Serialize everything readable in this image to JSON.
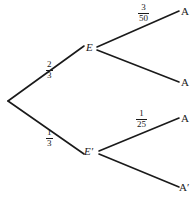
{
  "diagram": {
    "type": "probability-tree",
    "title": "",
    "background_color": "#ffffff",
    "line_color": "#1a1a1a",
    "root": {
      "label": "",
      "x": 8,
      "y": 101
    },
    "nodes": [
      {
        "id": "E",
        "label": "E",
        "x": 88,
        "y": 48
      },
      {
        "id": "Eprime",
        "label": "E′",
        "x": 88,
        "y": 152
      }
    ],
    "leaves": [
      {
        "id": "leaf-1",
        "label": "A",
        "x": 181,
        "y": 12
      },
      {
        "id": "leaf-2",
        "label": "A",
        "x": 181,
        "y": 83
      },
      {
        "id": "leaf-3",
        "label": "A",
        "x": 181,
        "y": 119
      },
      {
        "id": "leaf-4",
        "label": "A′",
        "x": 181,
        "y": 188
      }
    ],
    "branches": [
      {
        "id": "branch-root-E",
        "from": "root",
        "to": "E",
        "probability": {
          "numerator": "2",
          "denominator": "3"
        },
        "label_x": 46,
        "label_y": 60
      },
      {
        "id": "branch-root-Eprime",
        "from": "root",
        "to": "Eprime",
        "probability": {
          "numerator": "1",
          "denominator": "3"
        },
        "label_x": 46,
        "label_y": 128
      },
      {
        "id": "branch-E-A",
        "from": "E",
        "to": "leaf-1",
        "probability": {
          "numerator": "3",
          "denominator": "50"
        },
        "label_x": 138,
        "label_y": 3
      },
      {
        "id": "branch-E-Aprime",
        "from": "E",
        "to": "leaf-2",
        "probability": {
          "numerator": "",
          "denominator": ""
        },
        "label_x": 0,
        "label_y": 0
      },
      {
        "id": "branch-Eprime-A",
        "from": "Eprime",
        "to": "leaf-3",
        "probability": {
          "numerator": "1",
          "denominator": "25"
        },
        "label_x": 136,
        "label_y": 109
      },
      {
        "id": "branch-Eprime-Aprime",
        "from": "Eprime",
        "to": "leaf-4",
        "probability": {
          "numerator": "",
          "denominator": ""
        },
        "label_x": 0,
        "label_y": 0
      }
    ]
  }
}
